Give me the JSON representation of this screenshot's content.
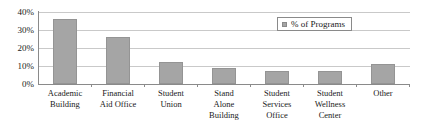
{
  "chart_data": {
    "type": "bar",
    "title": "",
    "xlabel": "",
    "ylabel": "",
    "ylim": [
      0,
      40
    ],
    "yticks": [
      "0%",
      "10%",
      "20%",
      "30%",
      "40%"
    ],
    "ytick_values": [
      0,
      10,
      20,
      30,
      40
    ],
    "grid": true,
    "legend_position": "top-right",
    "legend": [
      "% of Programs"
    ],
    "series_name": "% of Programs",
    "categories": [
      "Academic Building",
      "Financial Aid Office",
      "Student Union",
      "Stand Alone Building",
      "Student Services Office",
      "Student Wellness Center",
      "Other"
    ],
    "category_lines": [
      [
        "Academic",
        "Building"
      ],
      [
        "Financial",
        "Aid Office"
      ],
      [
        "Student",
        "Union"
      ],
      [
        "Stand",
        "Alone",
        "Building"
      ],
      [
        "Student",
        "Services",
        "Office"
      ],
      [
        "Student",
        "Wellness",
        "Center"
      ],
      [
        "Other"
      ]
    ],
    "values": [
      36,
      26,
      12,
      9,
      7,
      7,
      11
    ],
    "bar_color": "#a5a5a5",
    "bar_border_color": "#949494",
    "grid_color": "#c9c9c9",
    "axis_color": "#8a8a8a"
  }
}
